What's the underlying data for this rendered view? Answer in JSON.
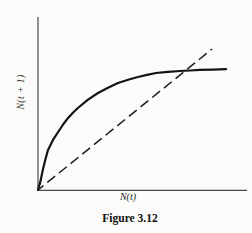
{
  "figure": {
    "caption": "Figure 3.12",
    "xlabel": "N(t)",
    "ylabel": "N(t + 1)"
  },
  "colors": {
    "paper": "#fbfbf9",
    "axis": "#4a4a4a",
    "solid_curve": "#141414",
    "dashed_line": "#1c1c1c"
  },
  "chart_data": {
    "type": "line",
    "title": "",
    "caption": "Figure 3.12",
    "xlabel": "N(t)",
    "ylabel": "N(t + 1)",
    "axis_ticks": "none (qualitative sketch, unlabeled axes)",
    "grid": false,
    "legend": "none",
    "xlim": [
      0,
      1
    ],
    "ylim": [
      0,
      1
    ],
    "series": [
      {
        "name": "reproduction-curve",
        "style": "solid",
        "points": [
          [
            0.0,
            0.0
          ],
          [
            0.012,
            0.052
          ],
          [
            0.024,
            0.122
          ],
          [
            0.036,
            0.18
          ],
          [
            0.048,
            0.233
          ],
          [
            0.072,
            0.291
          ],
          [
            0.096,
            0.337
          ],
          [
            0.12,
            0.381
          ],
          [
            0.144,
            0.419
          ],
          [
            0.167,
            0.449
          ],
          [
            0.191,
            0.477
          ],
          [
            0.239,
            0.525
          ],
          [
            0.287,
            0.564
          ],
          [
            0.335,
            0.595
          ],
          [
            0.383,
            0.622
          ],
          [
            0.431,
            0.641
          ],
          [
            0.478,
            0.657
          ],
          [
            0.522,
            0.669
          ],
          [
            0.565,
            0.68
          ],
          [
            0.622,
            0.687
          ],
          [
            0.679,
            0.692
          ],
          [
            0.727,
            0.695
          ],
          [
            0.775,
            0.698
          ],
          [
            0.837,
            0.7
          ],
          [
            0.9,
            0.703
          ]
        ]
      },
      {
        "name": "replacement-line",
        "style": "dashed",
        "points": [
          [
            0.0,
            0.0
          ],
          [
            0.833,
            0.82
          ]
        ]
      }
    ]
  }
}
